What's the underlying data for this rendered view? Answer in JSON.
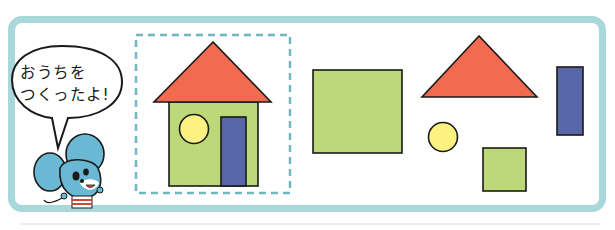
{
  "speech_bubble": {
    "line1": "おうちを",
    "line2": "つくったよ!"
  },
  "colors": {
    "frame": "#a9d8da",
    "dashed_border": "#6fb8bf",
    "roof_red": "#f26b50",
    "wall_green": "#bcd878",
    "window_yellow": "#fdf281",
    "door_blue": "#5867a8",
    "mouse_blue": "#6ab8d4",
    "outline": "#1a1a1a"
  },
  "house_composition": {
    "parts": [
      "triangle-roof",
      "square-wall",
      "circle-window",
      "rectangle-door"
    ]
  },
  "loose_shapes": [
    "large-green-square",
    "red-triangle",
    "blue-rectangle",
    "yellow-circle",
    "small-green-square"
  ]
}
